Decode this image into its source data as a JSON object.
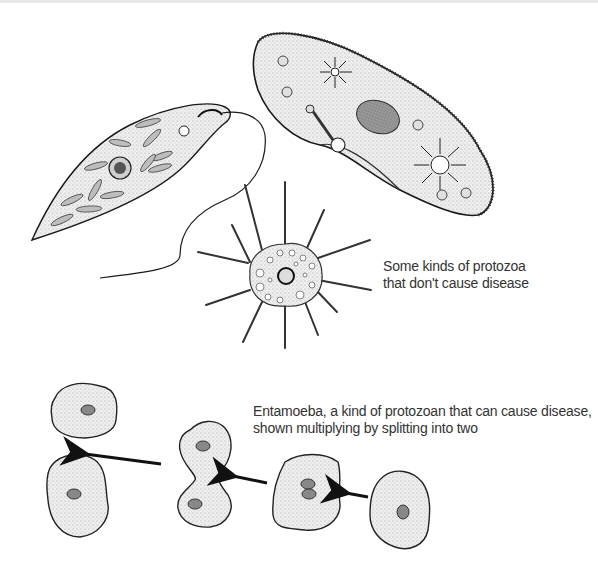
{
  "figure": {
    "captions": {
      "non_disease": {
        "line1": "Some kinds of protozoa",
        "line2": "that don't cause disease"
      },
      "disease": {
        "line1": "Entamoeba, a kind of protozoan that can cause disease,",
        "line2": "shown multiplying by splitting into two"
      }
    },
    "organisms": [
      {
        "name": "euglena",
        "group": "non-disease"
      },
      {
        "name": "paramecium",
        "group": "non-disease"
      },
      {
        "name": "heliozoan",
        "group": "non-disease"
      },
      {
        "name": "entamoeba-stage-1",
        "group": "disease"
      },
      {
        "name": "entamoeba-stage-2",
        "group": "disease"
      },
      {
        "name": "entamoeba-stage-3",
        "group": "disease"
      },
      {
        "name": "entamoeba-daughter-cells",
        "group": "disease"
      }
    ],
    "colors": {
      "outline": "#1a1a1a",
      "fill": "#e9e9e9",
      "nucleus": "#8a8a8a",
      "text": "#333333"
    }
  }
}
